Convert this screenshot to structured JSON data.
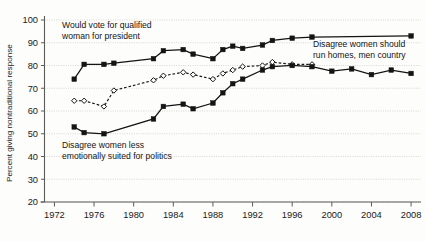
{
  "chart_data": {
    "type": "line",
    "title": "",
    "xlabel": "",
    "ylabel": "Percent giving nontraditional response",
    "xlim": [
      1971,
      2009
    ],
    "ylim": [
      20,
      100
    ],
    "yticks": [
      20,
      30,
      40,
      50,
      60,
      70,
      80,
      90,
      100
    ],
    "xticks": [
      1972,
      1976,
      1980,
      1984,
      1988,
      1992,
      1996,
      2000,
      2004,
      2008
    ],
    "grid": true,
    "legend_position": "inline-annotations",
    "series": [
      {
        "name": "Would vote for qualified woman for president",
        "marker": "filled-square",
        "line": "solid",
        "color": "#141414",
        "x": [
          1974,
          1975,
          1977,
          1978,
          1982,
          1983,
          1985,
          1986,
          1988,
          1989,
          1990,
          1991,
          1993,
          1994,
          1996,
          1998,
          2008
        ],
        "values": [
          74,
          80.5,
          80.5,
          81,
          83,
          86.5,
          87,
          85,
          83,
          87,
          88.5,
          87.5,
          89,
          91,
          92,
          92.5,
          93
        ]
      },
      {
        "name": "Disagree women should run homes, men country",
        "marker": "open-diamond",
        "line": "dashed",
        "color": "#141414",
        "x": [
          1974,
          1975,
          1977,
          1978,
          1982,
          1983,
          1985,
          1986,
          1988,
          1989,
          1990,
          1991,
          1993,
          1994,
          1996,
          1998
        ],
        "values": [
          64.5,
          64.5,
          62,
          69,
          73.5,
          75.5,
          77,
          76,
          74,
          76.5,
          78,
          79.5,
          80,
          81.5,
          80.5,
          80.5
        ]
      },
      {
        "name": "Disagree women less emotionally suited for politics",
        "marker": "filled-square",
        "line": "solid",
        "color": "#141414",
        "x": [
          1974,
          1975,
          1977,
          1982,
          1983,
          1985,
          1986,
          1988,
          1989,
          1990,
          1991,
          1993,
          1994,
          1996,
          1998,
          2000,
          2002,
          2004,
          2006,
          2008
        ],
        "values": [
          53,
          50.5,
          50,
          56.5,
          62,
          63,
          61,
          63.5,
          68,
          72,
          74,
          78,
          79.5,
          80,
          79.5,
          77.5,
          78.5,
          76,
          78,
          76.5
        ]
      }
    ],
    "annotations": [
      {
        "id": "annot-vote-woman-president",
        "lines": [
          "Would vote for qualified",
          "woman for president"
        ],
        "x_px": 62,
        "y_px": 28
      },
      {
        "id": "annot-run-homes",
        "lines": [
          "Disagree women should",
          "run homes, men country"
        ],
        "x_px": 313,
        "y_px": 47
      },
      {
        "id": "annot-emotionally-suited",
        "lines": [
          "Disagree women less",
          "emotionally suited for politics"
        ],
        "x_px": 62,
        "y_px": 148
      }
    ]
  },
  "axis": {
    "y_label": "Percent giving nontraditional response",
    "y_ticks": [
      "100",
      "90",
      "80",
      "70",
      "60",
      "50",
      "40",
      "30",
      "20"
    ],
    "x_ticks": [
      "1972",
      "1976",
      "1980",
      "1984",
      "1988",
      "1992",
      "1996",
      "2000",
      "2004",
      "2008"
    ]
  },
  "colors": {
    "background": "#fdfdfb",
    "ink": "#141414",
    "grid": "#c9c6bd",
    "axis": "#5b5b57"
  }
}
